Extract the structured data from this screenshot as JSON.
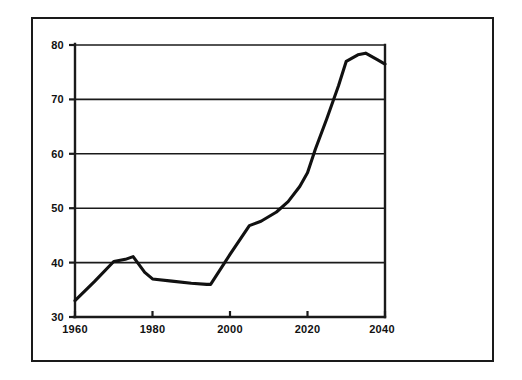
{
  "chart_data": {
    "type": "line",
    "title": "",
    "subtitle": "",
    "xlabel": "",
    "ylabel": "",
    "xlim": [
      1960,
      2040
    ],
    "ylim": [
      30,
      80
    ],
    "xticks": [
      1960,
      1980,
      2000,
      2020,
      2040
    ],
    "xtick_labels": [
      "1960",
      "1980",
      "2000",
      "2020",
      "2040"
    ],
    "yticks": [
      30,
      40,
      50,
      60,
      70,
      80
    ],
    "ytick_labels": [
      "30",
      "40",
      "50",
      "60",
      "70",
      "80"
    ],
    "grid": "horizontal",
    "legend": "none",
    "series": [
      {
        "name": "series-1",
        "color": "#111111",
        "x": [
          1960,
          1965,
          1970,
          1973,
          1975,
          1978,
          1980,
          1985,
          1990,
          1994,
          1995,
          2000,
          2005,
          2008,
          2012,
          2015,
          2018,
          2020,
          2022,
          2025,
          2028,
          2030,
          2033,
          2035,
          2038,
          2040
        ],
        "values": [
          33,
          36.5,
          40.2,
          40.6,
          41.1,
          38.2,
          37.0,
          36.6,
          36.2,
          36.0,
          36.0,
          41.5,
          46.8,
          47.6,
          49.3,
          51.2,
          54.0,
          56.5,
          60.8,
          66.5,
          72.5,
          77.0,
          78.2,
          78.5,
          77.3,
          76.5
        ]
      }
    ],
    "annotations": [],
    "notes": {
      "axis_style": "L-shaped axis with horizontal gridlines at each y tick",
      "frame": "outer rectangular border around the whole figure"
    }
  },
  "figure": {
    "background_color": "#ffffff",
    "line_color": "#111111",
    "axis_color": "#1a1a1a",
    "border_color": "#1a1a1a"
  }
}
